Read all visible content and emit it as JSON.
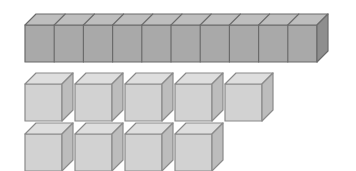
{
  "scene": {
    "title": "Base-ten blocks place-value illustration",
    "background_color": "#ffffff",
    "width": 356,
    "height": 171,
    "total_value": 19,
    "description": "One ten-rod made of 10 unit segments and 9 loose unit cubes arranged in two rows"
  },
  "palette": {
    "rod_front": "#a9a9a9",
    "rod_top": "#bebebe",
    "rod_side": "#8e8e8e",
    "rod_outline": "#6b6b6b",
    "rod_divider": "#6b6b6b",
    "cube_front": "#d2d2d2",
    "cube_top": "#dedede",
    "cube_side": "#bcbcbc",
    "cube_outline": "#8a8a8a",
    "background": "#ffffff"
  },
  "geometry": {
    "depth_x": 11,
    "depth_y": 11,
    "rod": {
      "label": "ten-rod",
      "segment_count": 10,
      "x": 25,
      "y": 25,
      "segment_width": 29.2,
      "height": 37,
      "value": 10
    },
    "cube": {
      "label": "unit-cube",
      "size": 37,
      "pitch": 50,
      "value": 1
    },
    "cube_rows": [
      {
        "row_label": "cube-row-top",
        "count": 5,
        "x": 25,
        "y": 84
      },
      {
        "row_label": "cube-row-bottom",
        "count": 4,
        "x": 25,
        "y": 134
      }
    ]
  },
  "counts": {
    "rods": 1,
    "rod_segments": 10,
    "loose_cubes": 9,
    "tens_label": "1 ten",
    "ones_label": "9 ones"
  }
}
